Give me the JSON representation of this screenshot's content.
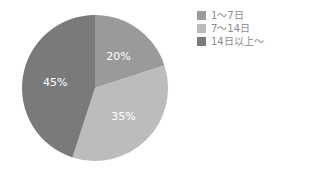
{
  "chart_data": {
    "type": "pie",
    "title": "",
    "categories": [
      "1～7日",
      "7～14日",
      "14日以上～"
    ],
    "values": [
      20,
      35,
      45
    ],
    "labels": [
      "20%",
      "35%",
      "45%"
    ],
    "colors": [
      "#9a9a9a",
      "#bcbcbc",
      "#7a7a7a"
    ],
    "start_angle_deg": 0,
    "direction": "clockwise",
    "legend_position": "top-right"
  },
  "legend": {
    "items": [
      {
        "label": "1～7日",
        "color": "#9a9a9a"
      },
      {
        "label": "7～14日",
        "color": "#bcbcbc"
      },
      {
        "label": "14日以上～",
        "color": "#7a7a7a"
      }
    ]
  }
}
